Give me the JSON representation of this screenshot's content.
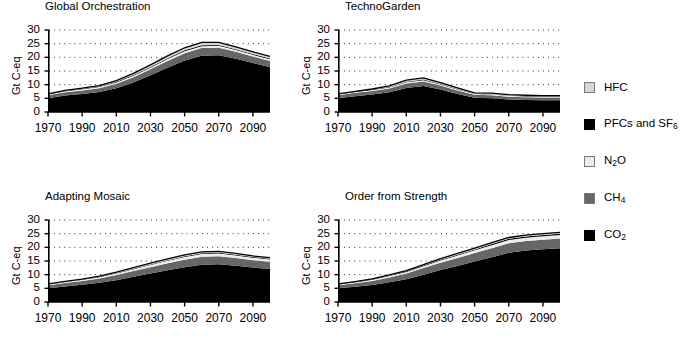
{
  "figure": {
    "units": "Gt C-eq"
  },
  "legend": {
    "items": [
      {
        "label": "HFC",
        "sub": "",
        "color": "#d5d5d5"
      },
      {
        "label": "PFCs and SF",
        "sub": "6",
        "color": "#000000"
      },
      {
        "label": "N",
        "sub": "2",
        "tail": "O",
        "color": "#ececec"
      },
      {
        "label": "CH",
        "sub": "4",
        "color": "#666666"
      },
      {
        "label": "CO",
        "sub": "2",
        "color": "#000000"
      }
    ]
  },
  "panels": [
    {
      "title": "Global Orchestration",
      "ylabel": "Gt C-eq"
    },
    {
      "title": "TechnoGarden",
      "ylabel": "Gt C-eq"
    },
    {
      "title": "Adapting Mosaic",
      "ylabel": "Gt C-eq"
    },
    {
      "title": "Order from Strength",
      "ylabel": "Gt C-eq"
    }
  ],
  "axis": {
    "yticks": [
      "30",
      "25",
      "20",
      "15",
      "10",
      "5",
      "0"
    ],
    "xticks": [
      "1970",
      "1990",
      "2010",
      "2030",
      "2050",
      "2070",
      "2090"
    ]
  },
  "chart_data": [
    {
      "type": "area",
      "title": "Global Orchestration",
      "xlabel": "",
      "ylabel": "Gt C-eq",
      "xlim": [
        1970,
        2100
      ],
      "ylim": [
        0,
        30
      ],
      "grid": true,
      "legend_position": "right-shared",
      "stacked": true,
      "x": [
        1970,
        1980,
        1990,
        2000,
        2010,
        2020,
        2030,
        2040,
        2050,
        2060,
        2070,
        2080,
        2090,
        2100
      ],
      "series": [
        {
          "name": "CO2",
          "color": "#000000",
          "values": [
            5.0,
            6.0,
            6.6,
            7.3,
            8.7,
            10.8,
            13.4,
            16.2,
            18.8,
            20.6,
            20.8,
            19.5,
            17.9,
            16.4
          ]
        },
        {
          "name": "CH4",
          "color": "#666666",
          "values": [
            1.1,
            1.2,
            1.3,
            1.4,
            1.6,
            1.9,
            2.2,
            2.5,
            2.7,
            2.8,
            2.7,
            2.5,
            2.4,
            2.3
          ]
        },
        {
          "name": "N2O",
          "color": "#ececec",
          "values": [
            0.3,
            0.35,
            0.4,
            0.45,
            0.5,
            0.55,
            0.6,
            0.65,
            0.7,
            0.7,
            0.7,
            0.65,
            0.6,
            0.6
          ]
        },
        {
          "name": "PFCs and SF6",
          "color": "#000000",
          "values": [
            0.15,
            0.18,
            0.2,
            0.22,
            0.25,
            0.28,
            0.3,
            0.32,
            0.35,
            0.35,
            0.33,
            0.3,
            0.3,
            0.28
          ]
        },
        {
          "name": "HFC",
          "color": "#d5d5d5",
          "values": [
            0.1,
            0.15,
            0.2,
            0.3,
            0.45,
            0.6,
            0.75,
            0.85,
            0.95,
            1.0,
            0.95,
            0.85,
            0.8,
            0.75
          ]
        }
      ],
      "totals": [
        6.65,
        7.88,
        8.7,
        9.67,
        11.5,
        14.13,
        17.25,
        20.52,
        23.5,
        25.45,
        25.48,
        23.8,
        21.9,
        20.33
      ]
    },
    {
      "type": "area",
      "title": "TechnoGarden",
      "xlabel": "",
      "ylabel": "Gt C-eq",
      "xlim": [
        1970,
        2100
      ],
      "ylim": [
        0,
        30
      ],
      "grid": true,
      "legend_position": "right-shared",
      "stacked": true,
      "x": [
        1970,
        1980,
        1990,
        2000,
        2010,
        2020,
        2030,
        2040,
        2050,
        2060,
        2070,
        2080,
        2090,
        2100
      ],
      "series": [
        {
          "name": "CO2",
          "color": "#000000",
          "values": [
            5.0,
            5.8,
            6.4,
            7.2,
            8.8,
            9.5,
            8.2,
            6.6,
            5.2,
            5.0,
            4.6,
            4.4,
            4.3,
            4.3
          ]
        },
        {
          "name": "CH4",
          "color": "#666666",
          "values": [
            1.1,
            1.2,
            1.3,
            1.4,
            1.6,
            1.7,
            1.5,
            1.3,
            1.1,
            1.1,
            1.0,
            1.0,
            1.0,
            1.0
          ]
        },
        {
          "name": "N2O",
          "color": "#ececec",
          "values": [
            0.3,
            0.32,
            0.35,
            0.4,
            0.45,
            0.45,
            0.4,
            0.35,
            0.3,
            0.3,
            0.3,
            0.3,
            0.3,
            0.3
          ]
        },
        {
          "name": "PFCs and SF6",
          "color": "#000000",
          "values": [
            0.12,
            0.14,
            0.16,
            0.18,
            0.2,
            0.2,
            0.18,
            0.15,
            0.12,
            0.12,
            0.12,
            0.12,
            0.12,
            0.12
          ]
        },
        {
          "name": "HFC",
          "color": "#d5d5d5",
          "values": [
            0.08,
            0.12,
            0.2,
            0.35,
            0.6,
            0.65,
            0.5,
            0.4,
            0.3,
            0.35,
            0.3,
            0.3,
            0.3,
            0.3
          ]
        }
      ],
      "totals": [
        6.6,
        7.58,
        8.41,
        9.53,
        11.65,
        12.5,
        10.78,
        8.8,
        7.02,
        6.87,
        6.32,
        6.12,
        6.02,
        6.02
      ]
    },
    {
      "type": "area",
      "title": "Adapting Mosaic",
      "xlabel": "",
      "ylabel": "Gt C-eq",
      "xlim": [
        1970,
        2100
      ],
      "ylim": [
        0,
        30
      ],
      "grid": true,
      "legend_position": "right-shared",
      "stacked": true,
      "x": [
        1970,
        1980,
        1990,
        2000,
        2010,
        2020,
        2030,
        2040,
        2050,
        2060,
        2070,
        2080,
        2090,
        2100
      ],
      "series": [
        {
          "name": "CO2",
          "color": "#000000",
          "values": [
            5.0,
            5.7,
            6.3,
            7.0,
            8.0,
            9.2,
            10.4,
            11.6,
            12.7,
            13.6,
            13.8,
            13.3,
            12.6,
            12.1
          ]
        },
        {
          "name": "CH4",
          "color": "#666666",
          "values": [
            1.1,
            1.25,
            1.4,
            1.6,
            1.85,
            2.1,
            2.35,
            2.6,
            2.8,
            2.95,
            2.9,
            2.8,
            2.7,
            2.6
          ]
        },
        {
          "name": "N2O",
          "color": "#ececec",
          "values": [
            0.3,
            0.35,
            0.4,
            0.45,
            0.55,
            0.65,
            0.75,
            0.85,
            0.95,
            1.0,
            1.0,
            0.95,
            0.9,
            0.85
          ]
        },
        {
          "name": "PFCs and SF6",
          "color": "#000000",
          "values": [
            0.12,
            0.14,
            0.16,
            0.18,
            0.2,
            0.22,
            0.24,
            0.26,
            0.28,
            0.3,
            0.3,
            0.28,
            0.26,
            0.25
          ]
        },
        {
          "name": "HFC",
          "color": "#d5d5d5",
          "values": [
            0.08,
            0.1,
            0.14,
            0.2,
            0.3,
            0.4,
            0.45,
            0.5,
            0.5,
            0.5,
            0.5,
            0.45,
            0.4,
            0.4
          ]
        }
      ],
      "totals": [
        6.6,
        7.54,
        8.4,
        9.43,
        10.9,
        12.57,
        14.19,
        15.81,
        17.23,
        18.35,
        18.5,
        17.78,
        16.86,
        16.2
      ]
    },
    {
      "type": "area",
      "title": "Order from Strength",
      "xlabel": "",
      "ylabel": "Gt C-eq",
      "xlim": [
        1970,
        2100
      ],
      "ylim": [
        0,
        30
      ],
      "grid": true,
      "legend_position": "right-shared",
      "stacked": true,
      "x": [
        1970,
        1980,
        1990,
        2000,
        2010,
        2020,
        2030,
        2040,
        2050,
        2060,
        2070,
        2080,
        2090,
        2100
      ],
      "series": [
        {
          "name": "CO2",
          "color": "#000000",
          "values": [
            5.0,
            5.6,
            6.2,
            7.2,
            8.3,
            10.0,
            11.7,
            13.2,
            14.8,
            16.4,
            18.0,
            18.8,
            19.3,
            19.7
          ]
        },
        {
          "name": "CH4",
          "color": "#666666",
          "values": [
            1.1,
            1.3,
            1.5,
            1.8,
            2.1,
            2.4,
            2.7,
            2.9,
            3.1,
            3.3,
            3.5,
            3.5,
            3.5,
            3.5
          ]
        },
        {
          "name": "N2O",
          "color": "#ececec",
          "values": [
            0.3,
            0.35,
            0.42,
            0.5,
            0.6,
            0.7,
            0.8,
            0.9,
            1.0,
            1.1,
            1.2,
            1.25,
            1.3,
            1.35
          ]
        },
        {
          "name": "PFCs and SF6",
          "color": "#000000",
          "values": [
            0.12,
            0.14,
            0.17,
            0.2,
            0.23,
            0.26,
            0.29,
            0.32,
            0.35,
            0.38,
            0.4,
            0.42,
            0.44,
            0.45
          ]
        },
        {
          "name": "HFC",
          "color": "#d5d5d5",
          "values": [
            0.08,
            0.1,
            0.14,
            0.2,
            0.27,
            0.34,
            0.4,
            0.45,
            0.5,
            0.5,
            0.5,
            0.5,
            0.5,
            0.5
          ]
        }
      ],
      "totals": [
        6.6,
        7.49,
        8.43,
        9.9,
        11.5,
        13.7,
        15.89,
        17.77,
        19.75,
        21.68,
        23.6,
        24.47,
        25.04,
        25.5
      ]
    }
  ]
}
